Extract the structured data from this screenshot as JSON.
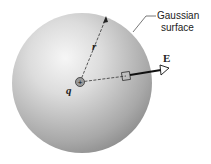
{
  "figure": {
    "labels": {
      "surface_line1": "Gaussian",
      "surface_line2": "surface",
      "radius": "r",
      "charge": "q",
      "field": "E",
      "charge_sign": "+"
    },
    "colors": {
      "sphere_highlight": "#f4f4f4",
      "sphere_shadow": "#8e8e8e",
      "charge_fill": "#9a9a9a",
      "line": "#333333"
    }
  }
}
